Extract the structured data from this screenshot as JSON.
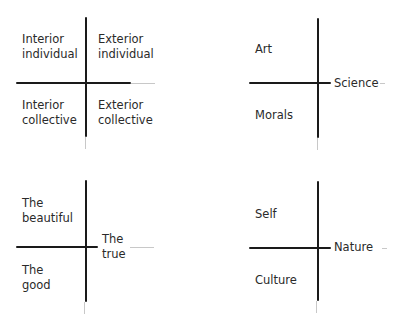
{
  "diagrams": [
    {
      "id": "quadrants",
      "labels": {
        "top_left": [
          "Interior",
          "individual"
        ],
        "top_right": [
          "Exterior",
          "individual"
        ],
        "bottom_left": [
          "Interior",
          "collective"
        ],
        "bottom_right": [
          "Exterior",
          "collective"
        ]
      }
    },
    {
      "id": "art-science-morals",
      "labels": {
        "top_left": [
          "Art"
        ],
        "axis_right": [
          "Science"
        ],
        "bottom_left": [
          "Morals"
        ]
      }
    },
    {
      "id": "beautiful-true-good",
      "labels": {
        "top_left": [
          "The",
          "beautiful"
        ],
        "axis_right": [
          "The",
          "true"
        ],
        "bottom_left": [
          "The",
          "good"
        ]
      }
    },
    {
      "id": "self-nature-culture",
      "labels": {
        "top_left": [
          "Self"
        ],
        "axis_right": [
          "Nature"
        ],
        "bottom_left": [
          "Culture"
        ]
      }
    }
  ],
  "colors": {
    "line": "#1a1a1a",
    "text": "#2a2a2a",
    "background": "#ffffff"
  }
}
